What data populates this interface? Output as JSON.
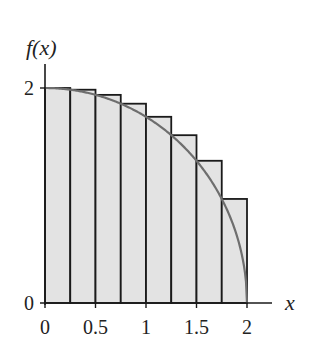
{
  "chart_data": {
    "type": "bar",
    "title": "",
    "xlabel": "x",
    "ylabel": "f(x)",
    "xlim": [
      0,
      2
    ],
    "ylim": [
      0,
      2
    ],
    "x_ticks": [
      "0",
      "0.5",
      "1",
      "1.5",
      "2"
    ],
    "y_ticks": [
      "0",
      "2"
    ],
    "bar_width": 0.25,
    "categories": [
      "0",
      "0.25",
      "0.5",
      "0.75",
      "1",
      "1.25",
      "1.5",
      "1.75"
    ],
    "values": [
      2.0,
      1.984,
      1.936,
      1.854,
      1.732,
      1.561,
      1.323,
      0.968
    ],
    "curve": {
      "name": "f(x)",
      "x": [
        0,
        0.25,
        0.5,
        0.75,
        1,
        1.25,
        1.5,
        1.75,
        1.9,
        2
      ],
      "y": [
        2.0,
        1.984,
        1.936,
        1.854,
        1.732,
        1.561,
        1.323,
        0.968,
        0.624,
        0.0
      ]
    },
    "grid": false,
    "legend": null
  },
  "labels": {
    "y_axis": "f(x)",
    "x_axis": "x",
    "y_tick_top": "2",
    "y_tick_zero": "0",
    "x_ticks": [
      "0",
      "0.5",
      "1",
      "1.5",
      "2"
    ]
  },
  "colors": {
    "bar_fill": "#e3e3e3",
    "bar_stroke": "#1a1a1a",
    "curve": "#6e6e6e",
    "axis": "#1a1a1a"
  }
}
